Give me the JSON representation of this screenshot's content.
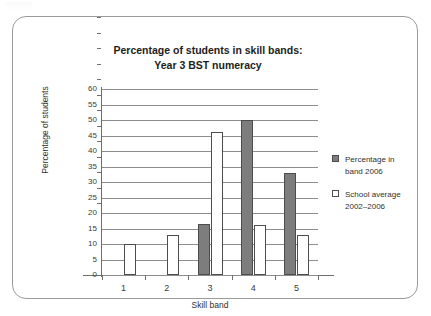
{
  "chart_data": {
    "type": "bar",
    "title": "Percentage of students in skill bands:",
    "subtitle": "Year 3 BST numeracy",
    "xlabel": "Skill band",
    "ylabel": "Percentage of students",
    "categories": [
      "1",
      "2",
      "3",
      "4",
      "5"
    ],
    "ylim": [
      0,
      60
    ],
    "ytick_labels": [
      "60",
      "55",
      "50",
      "45",
      "40",
      "35",
      "30",
      "25",
      "20",
      "15",
      "10",
      "5",
      "0"
    ],
    "ytick_values": [
      60,
      55,
      50,
      45,
      40,
      35,
      30,
      25,
      20,
      15,
      10,
      5,
      0
    ],
    "ytick_step": 5,
    "grid": true,
    "legend_position": "right",
    "series": [
      {
        "name": "Percentage in band 2006",
        "name_line1": "Percentage in",
        "name_line2": "band 2006",
        "style": "filled",
        "color": "#7d7d7d",
        "values": [
          null,
          null,
          16.5,
          50,
          33
        ]
      },
      {
        "name": "School average 2002–2006",
        "name_line1": "School average",
        "name_line2": "2002–2006",
        "style": "hollow",
        "color": "#ffffff",
        "values": [
          10,
          13,
          46,
          16,
          13
        ]
      }
    ]
  },
  "colors": {
    "frame": "#9a9a9a",
    "axis": "#6f6f6f",
    "gridline": "#8d8d8d",
    "bar_filled": "#7d7d7d",
    "bar_outline": "#4d4d4d",
    "background": "#ffffff"
  }
}
